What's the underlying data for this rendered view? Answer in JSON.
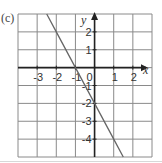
{
  "figure": {
    "part_label": "(c)"
  },
  "chart_data": {
    "type": "line",
    "title": "",
    "xlabel": "x",
    "ylabel": "y",
    "xlim": [
      -4,
      3
    ],
    "ylim": [
      -5,
      3
    ],
    "grid": true,
    "x_ticks": [
      -3,
      -2,
      -1,
      0,
      1,
      2
    ],
    "x_tick_labels": [
      "-3",
      "-2",
      "-1",
      "0",
      "1",
      "2"
    ],
    "y_ticks": [
      2,
      1,
      -1,
      -2,
      -3,
      -4
    ],
    "y_tick_labels": [
      "2",
      "1",
      "-1",
      "-2",
      "-3",
      "-4"
    ],
    "series": [
      {
        "name": "y = -2x - 2",
        "x": [
          -2.5,
          -2,
          -1,
          0,
          1,
          1.5
        ],
        "y": [
          3,
          2,
          0,
          -2,
          -4,
          -5
        ]
      }
    ],
    "colors": {
      "grid": "#8a8a8a",
      "axis": "#222222",
      "line": "#666666",
      "label": "#333333"
    }
  }
}
